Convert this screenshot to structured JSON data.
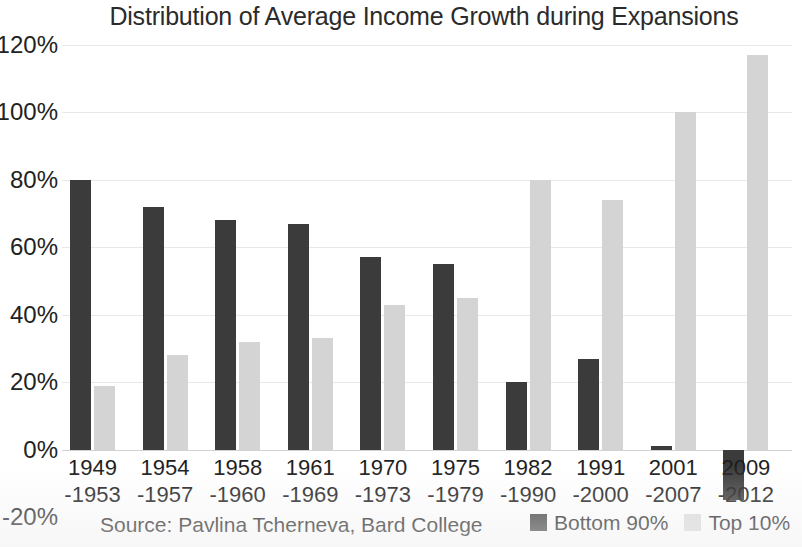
{
  "chart_data": {
    "type": "bar",
    "title": "Distribution of Average Income Growth during Expansions",
    "xlabel": "",
    "ylabel": "",
    "ylim": [
      -20,
      120
    ],
    "ytick_step": 20,
    "ytick_labels": [
      "120%",
      "100%",
      "80%",
      "60%",
      "40%",
      "20%",
      "0%",
      "-20%"
    ],
    "ytick_values": [
      120,
      100,
      80,
      60,
      40,
      20,
      0,
      -20
    ],
    "grid": true,
    "legend_position": "bottom-right",
    "categories": [
      "1949\n-1953",
      "1954\n-1957",
      "1958\n-1960",
      "1961\n-1969",
      "1970\n-1973",
      "1975\n-1979",
      "1982\n-1990",
      "1991\n-2000",
      "2001\n-2007",
      "2009\n-2012"
    ],
    "category_lines": [
      {
        "line1": "1949",
        "line2": "-1953"
      },
      {
        "line1": "1954",
        "line2": "-1957"
      },
      {
        "line1": "1958",
        "line2": "-1960"
      },
      {
        "line1": "1961",
        "line2": "-1969"
      },
      {
        "line1": "1970",
        "line2": "-1973"
      },
      {
        "line1": "1975",
        "line2": "-1979"
      },
      {
        "line1": "1982",
        "line2": "-1990"
      },
      {
        "line1": "1991",
        "line2": "-2000"
      },
      {
        "line1": "2001",
        "line2": "-2007"
      },
      {
        "line1": "2009",
        "line2": "-2012"
      }
    ],
    "series": [
      {
        "name": "Bottom 90%",
        "color": "#3b3b3b",
        "values": [
          80,
          72,
          68,
          67,
          57,
          55,
          20,
          27,
          1,
          -15
        ]
      },
      {
        "name": "Top 10%",
        "color": "#d4d4d4",
        "values": [
          19,
          28,
          32,
          33,
          43,
          45,
          80,
          74,
          100,
          117
        ]
      }
    ],
    "source_note": "Source: Pavlina Tcherneva, Bard College"
  },
  "legend": {
    "items": [
      {
        "label": "Bottom 90%",
        "swatch": "dark"
      },
      {
        "label": "Top 10%",
        "swatch": "light"
      }
    ]
  }
}
